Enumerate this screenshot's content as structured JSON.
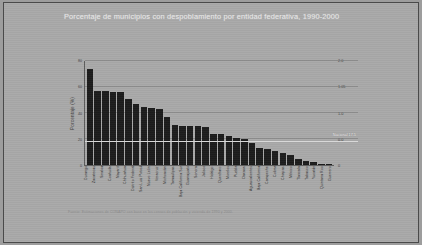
{
  "slide": {
    "title": "Porcentaje de municipios con despoblamiento por entidad federativa, 1990-2000",
    "source": "Fuente: Estimaciones de CONAPO con base en los censos de población y vivienda de 1990 y 2000."
  },
  "chart_data": {
    "type": "bar",
    "title": "Porcentaje de municipios con despoblamiento por entidad federativa, 1990-2000",
    "xlabel": "",
    "ylabel": "Porcentaje (%)",
    "ylim": [
      0,
      80
    ],
    "yticks": [
      0,
      20,
      40,
      60,
      80
    ],
    "ytick_labels": [
      "0",
      "20",
      "40",
      "60",
      "80"
    ],
    "right_tick_labels": [
      "0",
      "0.0",
      "1.0",
      "1.05",
      "2.0"
    ],
    "grid": true,
    "legend": "none",
    "annotation": {
      "label": "Nacional 17.5",
      "value": 17.5
    },
    "categories": [
      "Durango",
      "Zacatecas",
      "Sinaloa",
      "Coahuila",
      "Nayarit",
      "Chihuahua",
      "Distrito Federal",
      "San Luis Potosí",
      "Nuevo León",
      "Veracruz",
      "Michoacán",
      "Tamaulipas",
      "Baja California Sur",
      "Guanajuato",
      "Sonora",
      "Jalisco",
      "Hidalgo",
      "Querétaro",
      "Morelos",
      "Puebla",
      "Oaxaca",
      "Aguascalientes",
      "Baja California",
      "Campeche",
      "Colima",
      "Chiapas",
      "México",
      "Tlaxcala",
      "Tabasco",
      "Yucatán",
      "Quintana Roo",
      "Guerrero"
    ],
    "values": [
      74,
      57,
      57,
      56,
      56,
      51,
      47,
      45,
      44,
      43,
      37,
      31,
      30,
      30,
      30,
      29,
      24,
      24,
      22,
      21,
      20,
      17,
      13,
      12,
      11,
      9,
      8,
      5,
      3,
      2,
      1,
      1
    ]
  }
}
